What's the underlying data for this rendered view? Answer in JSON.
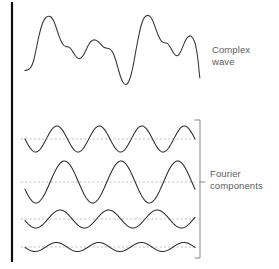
{
  "figure": {
    "background_color": "#ffffff",
    "width": 279,
    "height": 269
  },
  "labels": {
    "complex_wave": {
      "line1": "Complex",
      "line2": "wave"
    },
    "fourier_components": {
      "line1": "Fourier",
      "line2": "components"
    }
  },
  "colors": {
    "wave_stroke": "#2b2b2b",
    "complex_stroke": "#3a3a3a",
    "reference_line": "#aaaaaa",
    "axis_bar": "#111111",
    "bracket": "#777777",
    "label_text": "#5b5b5b",
    "background": "#ffffff"
  },
  "chart_data": {
    "type": "line",
    "xlabel": "",
    "ylabel": "",
    "grid": false,
    "legend_position": "right",
    "annotations": [
      {
        "text": "Complex wave",
        "x": 212,
        "y": 44
      },
      {
        "text": "Fourier components",
        "x": 210,
        "y": 168
      }
    ],
    "axis_bar": {
      "x": 12,
      "y_top": 2,
      "y_bottom": 262
    },
    "bracket": {
      "x": 200,
      "y_top": 120,
      "y_bottom": 258,
      "tick_length": 5,
      "mid_y": 182
    },
    "x_domain": [
      25,
      195
    ],
    "panels": [
      {
        "name": "complex-wave",
        "role": "sum",
        "baseline_y": 72,
        "amplitude_px": 56,
        "cycles": null,
        "reference_line": false,
        "description": "Irregular periodic waveform formed by summing the four Fourier components",
        "points": [
          [
            25.0,
            70.5
          ],
          [
            28.0,
            69.8
          ],
          [
            31.0,
            67.0
          ],
          [
            33.5,
            61.0
          ],
          [
            36.0,
            50.0
          ],
          [
            38.5,
            38.0
          ],
          [
            41.0,
            28.0
          ],
          [
            43.5,
            21.0
          ],
          [
            46.0,
            17.5
          ],
          [
            48.5,
            16.2
          ],
          [
            51.0,
            17.0
          ],
          [
            53.5,
            20.5
          ],
          [
            56.0,
            27.0
          ],
          [
            58.5,
            34.5
          ],
          [
            61.0,
            41.0
          ],
          [
            63.5,
            45.0
          ],
          [
            66.0,
            46.5
          ],
          [
            68.5,
            47.0
          ],
          [
            71.0,
            49.0
          ],
          [
            73.5,
            53.0
          ],
          [
            76.0,
            56.5
          ],
          [
            78.5,
            58.5
          ],
          [
            81.0,
            58.0
          ],
          [
            83.5,
            55.0
          ],
          [
            86.0,
            50.0
          ],
          [
            88.5,
            45.0
          ],
          [
            91.0,
            41.5
          ],
          [
            93.5,
            40.0
          ],
          [
            96.0,
            40.3
          ],
          [
            98.5,
            42.0
          ],
          [
            101.0,
            44.5
          ],
          [
            103.5,
            47.0
          ],
          [
            106.0,
            48.0
          ],
          [
            108.5,
            48.5
          ],
          [
            111.0,
            50.0
          ],
          [
            113.5,
            54.0
          ],
          [
            116.0,
            61.0
          ],
          [
            118.5,
            70.0
          ],
          [
            121.0,
            78.0
          ],
          [
            123.5,
            83.0
          ],
          [
            126.0,
            84.5
          ],
          [
            128.5,
            82.0
          ],
          [
            131.0,
            75.0
          ],
          [
            133.5,
            64.0
          ],
          [
            136.0,
            50.0
          ],
          [
            138.5,
            37.0
          ],
          [
            141.0,
            26.0
          ],
          [
            143.5,
            19.0
          ],
          [
            146.0,
            16.0
          ],
          [
            148.5,
            15.5
          ],
          [
            151.0,
            17.5
          ],
          [
            153.5,
            22.5
          ],
          [
            156.0,
            29.5
          ],
          [
            158.5,
            36.0
          ],
          [
            161.0,
            40.5
          ],
          [
            163.5,
            42.5
          ],
          [
            166.0,
            43.0
          ],
          [
            168.5,
            44.5
          ],
          [
            171.0,
            48.5
          ],
          [
            173.5,
            53.0
          ],
          [
            176.0,
            55.5
          ],
          [
            178.5,
            55.0
          ],
          [
            181.0,
            51.0
          ],
          [
            183.5,
            45.0
          ],
          [
            186.0,
            39.5
          ],
          [
            188.5,
            36.5
          ],
          [
            191.0,
            36.0
          ],
          [
            193.0,
            38.5
          ],
          [
            195.0,
            43.0
          ],
          [
            196.5,
            50.0
          ],
          [
            198.0,
            60.0
          ],
          [
            199.0,
            70.0
          ],
          [
            199.8,
            78.0
          ]
        ]
      },
      {
        "name": "component-1",
        "role": "harmonic",
        "baseline_y": 139,
        "amplitude_px": 13,
        "cycles": 4,
        "phase_deg": 180,
        "reference_line": true,
        "reference_y": 139
      },
      {
        "name": "component-2",
        "role": "harmonic",
        "baseline_y": 182,
        "amplitude_px": 21,
        "cycles": 3,
        "phase_deg": 200,
        "reference_line": true,
        "reference_y": 182
      },
      {
        "name": "component-3",
        "role": "harmonic",
        "baseline_y": 219,
        "amplitude_px": 9,
        "cycles": 3.5,
        "phase_deg": 190,
        "reference_line": true,
        "reference_y": 219
      },
      {
        "name": "component-4",
        "role": "harmonic",
        "baseline_y": 247,
        "amplitude_px": 4.5,
        "cycles": 4,
        "phase_deg": 185,
        "reference_line": true,
        "reference_y": 247
      }
    ]
  }
}
